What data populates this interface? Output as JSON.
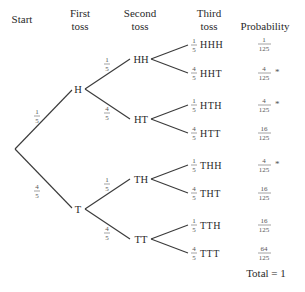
{
  "headers": {
    "start": "Start",
    "first_line1": "First",
    "first_line2": "toss",
    "second_line1": "Second",
    "second_line2": "toss",
    "third_line1": "Third",
    "third_line2": "toss",
    "probability": "Probability"
  },
  "first_toss": {
    "H": {
      "label": "H",
      "prob_num": "1",
      "prob_den": "5"
    },
    "T": {
      "label": "T",
      "prob_num": "4",
      "prob_den": "5"
    }
  },
  "second_toss": [
    {
      "label": "HH",
      "prob_num": "1",
      "prob_den": "5"
    },
    {
      "label": "HT",
      "prob_num": "4",
      "prob_den": "5"
    },
    {
      "label": "TH",
      "prob_num": "1",
      "prob_den": "5"
    },
    {
      "label": "TT",
      "prob_num": "4",
      "prob_den": "5"
    }
  ],
  "outcomes": [
    {
      "label": "HHH",
      "branch_num": "1",
      "branch_den": "5",
      "prob_num": "1",
      "prob_den": "125",
      "mark": ""
    },
    {
      "label": "HHT",
      "branch_num": "4",
      "branch_den": "5",
      "prob_num": "4",
      "prob_den": "125",
      "mark": "*"
    },
    {
      "label": "HTH",
      "branch_num": "1",
      "branch_den": "5",
      "prob_num": "4",
      "prob_den": "125",
      "mark": "*"
    },
    {
      "label": "HTT",
      "branch_num": "4",
      "branch_den": "5",
      "prob_num": "16",
      "prob_den": "125",
      "mark": ""
    },
    {
      "label": "THH",
      "branch_num": "1",
      "branch_den": "5",
      "prob_num": "4",
      "prob_den": "125",
      "mark": "*"
    },
    {
      "label": "THT",
      "branch_num": "4",
      "branch_den": "5",
      "prob_num": "16",
      "prob_den": "125",
      "mark": ""
    },
    {
      "label": "TTH",
      "branch_num": "1",
      "branch_den": "5",
      "prob_num": "16",
      "prob_den": "125",
      "mark": ""
    },
    {
      "label": "TTT",
      "branch_num": "4",
      "branch_den": "5",
      "prob_num": "64",
      "prob_den": "125",
      "mark": ""
    }
  ],
  "total": "Total = 1"
}
